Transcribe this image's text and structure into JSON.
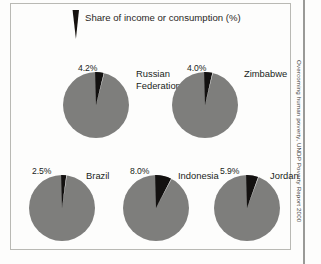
{
  "legend": {
    "label": "Share of income or consumption (%)",
    "swatch_name": "wedge-swatch",
    "swatch_color": "#131110"
  },
  "source_credit": "Overcoming human poverty, UNDP Poverty Report 2000",
  "colors": {
    "pie_base": "#7e7e7c",
    "pie_slice": "#131110",
    "frame": "#b9b9b4",
    "background": "#fdfdfc",
    "text": "#201d1b"
  },
  "chart_data": {
    "type": "pie",
    "title": "Share of income or consumption (%)",
    "subtitle": "",
    "xlabel": "",
    "ylabel": "",
    "legend_position": "top",
    "grid": false,
    "note": "Each pie shows the share of national income or consumption held by the poorest 20% of the population; the black wedge is that share, the grey remainder is the rest.",
    "categories": [
      "Russian Federation",
      "Zimbabwe",
      "Brazil",
      "Indonesia",
      "Jordan"
    ],
    "values": [
      4.2,
      4.0,
      2.5,
      8.0,
      5.9
    ],
    "value_labels": [
      "4.2%",
      "4.0%",
      "2.5%",
      "8.0%",
      "5.9%"
    ],
    "units": "%",
    "ylim": [
      0,
      100
    ],
    "pies": [
      {
        "name": "Russian Federation",
        "label_lines": [
          "Russian",
          "Federation"
        ],
        "value": 4.2,
        "value_label": "4.2%",
        "row": 1
      },
      {
        "name": "Zimbabwe",
        "label_lines": [
          "Zimbabwe"
        ],
        "value": 4.0,
        "value_label": "4.0%",
        "row": 1
      },
      {
        "name": "Brazil",
        "label_lines": [
          "Brazil"
        ],
        "value": 2.5,
        "value_label": "2.5%",
        "row": 2
      },
      {
        "name": "Indonesia",
        "label_lines": [
          "Indonesia"
        ],
        "value": 8.0,
        "value_label": "8.0%",
        "row": 2
      },
      {
        "name": "Jordan",
        "label_lines": [
          "Jordan"
        ],
        "value": 5.9,
        "value_label": "5.9%",
        "row": 2
      }
    ]
  }
}
